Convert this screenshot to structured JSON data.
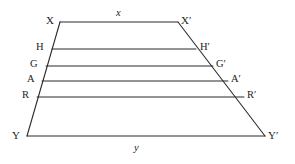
{
  "figure": {
    "type": "geometric-diagram",
    "shape": "trapezoid-with-parallel-chords",
    "background_color": "#ffffff",
    "stroke_color": "#2b2b2b",
    "label_color": "#1c1c1c",
    "canvas": {
      "width": 295,
      "height": 164
    },
    "vertices": [
      {
        "key": "X",
        "label": "X",
        "x": 60,
        "y": 22,
        "label_x": 46,
        "label_y": 15
      },
      {
        "key": "Xp",
        "label": "X′",
        "x": 178,
        "y": 22,
        "label_x": 181,
        "label_y": 15
      },
      {
        "key": "Y",
        "label": "Y",
        "x": 27,
        "y": 136,
        "label_x": 12,
        "label_y": 130
      },
      {
        "key": "Yp",
        "label": "Y′",
        "x": 265,
        "y": 136,
        "label_x": 268,
        "label_y": 130
      }
    ],
    "chords": [
      {
        "key": "H",
        "left_label": "H",
        "right_label": "H′",
        "y": 49,
        "x1": 52,
        "x2": 196,
        "left_label_x": 36,
        "left_label_y": 42,
        "right_label_x": 200,
        "right_label_y": 42
      },
      {
        "key": "G",
        "left_label": "G",
        "right_label": "G′",
        "y": 66,
        "x1": 46,
        "x2": 213,
        "left_label_x": 30,
        "left_label_y": 59,
        "right_label_x": 216,
        "right_label_y": 59
      },
      {
        "key": "A",
        "left_label": "A",
        "right_label": "A′",
        "y": 81,
        "x1": 42,
        "x2": 228,
        "left_label_x": 27,
        "left_label_y": 74,
        "right_label_x": 231,
        "right_label_y": 74
      },
      {
        "key": "R",
        "left_label": "R",
        "right_label": "R′",
        "y": 97,
        "x1": 37,
        "x2": 244,
        "left_label_x": 22,
        "left_label_y": 90,
        "right_label_x": 247,
        "right_label_y": 90
      }
    ],
    "side_labels": [
      {
        "key": "top",
        "label": "x",
        "x": 116,
        "y": 8
      },
      {
        "key": "bottom",
        "label": "y",
        "x": 134,
        "y": 143
      }
    ]
  }
}
